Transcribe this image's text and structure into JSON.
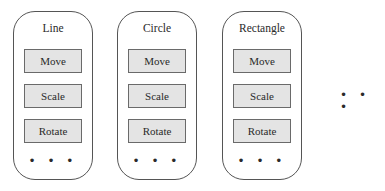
{
  "diagram": {
    "classes": [
      {
        "name": "Line",
        "methods": [
          "Move",
          "Scale",
          "Rotate"
        ],
        "more": "• • •"
      },
      {
        "name": "Circle",
        "methods": [
          "Move",
          "Scale",
          "Rotate"
        ],
        "more": "• • •"
      },
      {
        "name": "Rectangle",
        "methods": [
          "Move",
          "Scale",
          "Rotate"
        ],
        "more": "• • •"
      }
    ],
    "more_classes": "• • •"
  }
}
